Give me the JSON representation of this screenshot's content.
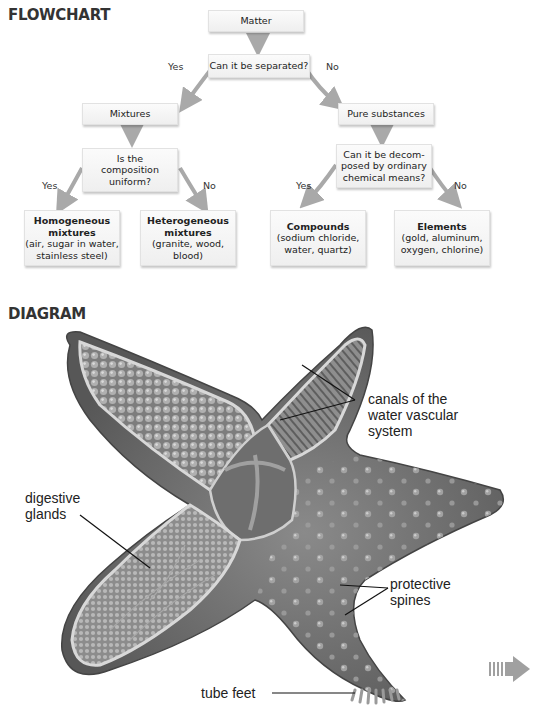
{
  "flowchart": {
    "title": "FLOWCHART",
    "nodes": {
      "matter": "Matter",
      "separated_q": "Can it be separated?",
      "mixtures": "Mixtures",
      "pure_substances": "Pure substances",
      "uniform_q": [
        "Is the",
        "composition",
        "uniform?"
      ],
      "decomposed_q": [
        "Can it be decom-",
        "posed by ordinary",
        "chemical means?"
      ],
      "homogeneous": {
        "title": [
          "Homogeneous",
          "mixtures"
        ],
        "examples": [
          "(air, sugar in water,",
          "stainless steel)"
        ]
      },
      "heterogeneous": {
        "title": [
          "Heterogeneous",
          "mixtures"
        ],
        "examples": [
          "(granite, wood,",
          "blood)"
        ]
      },
      "compounds": {
        "title": "Compounds",
        "examples": [
          "(sodium chloride,",
          "water, quartz)"
        ]
      },
      "elements": {
        "title": "Elements",
        "examples": [
          "(gold, aluminum,",
          "oxygen, chlorine)"
        ]
      }
    },
    "branch_labels": {
      "separated_yes": "Yes",
      "separated_no": "No",
      "uniform_yes": "Yes",
      "uniform_no": "No",
      "decomposed_yes": "Yes",
      "decomposed_no": "No"
    }
  },
  "diagram": {
    "title": "DIAGRAM",
    "labels": {
      "canals": [
        "canals of the",
        "water vascular",
        "system"
      ],
      "digestive": [
        "digestive",
        "glands"
      ],
      "spines": [
        "protective",
        "spines"
      ],
      "tube_feet": "tube feet"
    }
  },
  "continue_arrow": "continue-arrow-icon",
  "colors": {
    "arrow": "#a9a9a9",
    "box_bg": "#f4f4f4",
    "starfish_dark": "#5a5a5a",
    "starfish_mid": "#7a7a7a"
  }
}
